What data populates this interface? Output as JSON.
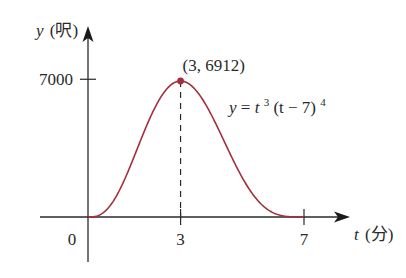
{
  "chart_data": {
    "type": "line",
    "title": "",
    "function_label": "y = t³(t − 7)⁴",
    "function_label_parts": {
      "lhs": "y",
      "eq": " = ",
      "t": "t",
      "exp1": "3",
      "mid": "(t − 7)",
      "exp2": "4"
    },
    "xlabel": "t (分)",
    "xlabel_parts": {
      "var": "t",
      "unit": "(分)"
    },
    "ylabel": "y (呎)",
    "ylabel_parts": {
      "var": "y",
      "unit": "(呎)"
    },
    "x_ticks": [
      {
        "value": 0,
        "label": "0"
      },
      {
        "value": 3,
        "label": "3"
      },
      {
        "value": 7,
        "label": "7"
      }
    ],
    "y_ticks": [
      {
        "value": 7000,
        "label": "7000"
      }
    ],
    "xlim": [
      0,
      7
    ],
    "ylim": [
      0,
      7000
    ],
    "grid": false,
    "legend": null,
    "series": [
      {
        "name": "y = t^3 (t - 7)^4",
        "color": "#a0303c",
        "x": [
          0,
          0.5,
          1,
          1.5,
          2,
          2.5,
          3,
          3.5,
          4,
          4.5,
          5,
          5.5,
          6,
          6.5,
          7
        ],
        "values": [
          0,
          1072.5,
          1296,
          1547.2,
          5000,
          6523.7,
          6912,
          6407.5,
          5184,
          3559.6,
          2000,
          841.8,
          216,
          17.2,
          0
        ]
      }
    ],
    "annotations": [
      {
        "type": "point",
        "x": 3,
        "y": 6912,
        "label": "(3, 6912)",
        "color": "#a0303c"
      },
      {
        "type": "dashed-vline",
        "x": 3,
        "from_y": 0,
        "to_y": 6912
      }
    ]
  },
  "colors": {
    "curve": "#a0303c",
    "axes": "#2a2a2a"
  }
}
